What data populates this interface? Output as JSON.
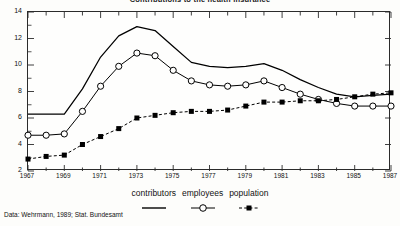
{
  "chart_data": {
    "type": "line",
    "title": "Contributions to the health insurance",
    "xlabel": "",
    "ylabel": "",
    "x": [
      1967,
      1968,
      1969,
      1970,
      1971,
      1972,
      1973,
      1974,
      1975,
      1976,
      1977,
      1978,
      1979,
      1980,
      1981,
      1982,
      1983,
      1984,
      1985,
      1986,
      1987
    ],
    "xlim": [
      1967,
      1987
    ],
    "ylim": [
      2,
      14
    ],
    "yticks": [
      2,
      4,
      6,
      8,
      10,
      12,
      14
    ],
    "xticks": [
      1967,
      1969,
      1971,
      1973,
      1975,
      1977,
      1979,
      1981,
      1983,
      1985,
      1987
    ],
    "grid": false,
    "legend_position": "bottom",
    "series": [
      {
        "name": "contributors",
        "marker": "none",
        "linestyle": "solid",
        "color": "#000000",
        "values": [
          6.3,
          6.3,
          6.3,
          8.2,
          10.6,
          12.2,
          12.9,
          12.6,
          11.4,
          10.2,
          9.9,
          9.8,
          9.9,
          10.1,
          9.6,
          8.9,
          8.3,
          7.8,
          7.6,
          7.7,
          7.8
        ]
      },
      {
        "name": "employees",
        "marker": "open-circle",
        "linestyle": "solid",
        "color": "#000000",
        "values": [
          4.7,
          4.7,
          4.8,
          6.5,
          8.4,
          9.9,
          10.9,
          10.7,
          9.6,
          8.8,
          8.5,
          8.4,
          8.5,
          8.8,
          8.3,
          7.8,
          7.4,
          7.1,
          6.9,
          6.9,
          6.9
        ]
      },
      {
        "name": "population",
        "marker": "filled-square",
        "linestyle": "dashed",
        "color": "#000000",
        "values": [
          2.9,
          3.1,
          3.2,
          4.0,
          4.6,
          5.2,
          6.0,
          6.2,
          6.4,
          6.5,
          6.5,
          6.6,
          6.9,
          7.2,
          7.2,
          7.3,
          7.3,
          7.4,
          7.6,
          7.8,
          7.9
        ]
      }
    ]
  },
  "legend": {
    "items": [
      {
        "label": "contributors",
        "marker": "line"
      },
      {
        "label": "employees",
        "marker": "open-circle"
      },
      {
        "label": "population",
        "marker": "filled-square"
      }
    ]
  },
  "footer": {
    "source": "Data: Wehrmann, 1989; Stat. Bundesamt"
  }
}
